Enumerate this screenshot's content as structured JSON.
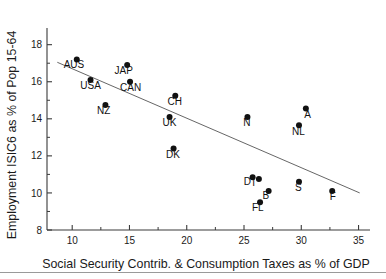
{
  "chart_data": {
    "type": "scatter",
    "title": "",
    "xlabel": "Social Security Contrib. & Consumption Taxes as % of GDP",
    "ylabel": "Employment ISIC6 as % of Pop 15-64",
    "xlim": [
      7.8,
      36.0
    ],
    "ylim": [
      8.0,
      18.9
    ],
    "xticks": [
      10,
      15,
      20,
      25,
      30,
      35
    ],
    "yticks": [
      8,
      10,
      12,
      14,
      16,
      18
    ],
    "xtick_labels": [
      "10",
      "15",
      "20",
      "25",
      "30",
      "35"
    ],
    "ytick_labels": [
      "8",
      "10",
      "12",
      "14",
      "16",
      "18"
    ],
    "grid": false,
    "legend": "none",
    "points": [
      {
        "label": "AUS",
        "x": 10.4,
        "y": 17.2,
        "lx": 10.15,
        "ly": 16.75,
        "anchor": "middle"
      },
      {
        "label": "USA",
        "x": 11.6,
        "y": 16.1,
        "lx": 11.6,
        "ly": 15.6,
        "anchor": "middle"
      },
      {
        "label": "NZ",
        "x": 12.9,
        "y": 14.75,
        "lx": 12.75,
        "ly": 14.25,
        "anchor": "middle"
      },
      {
        "label": "JAP",
        "x": 14.8,
        "y": 16.9,
        "lx": 14.5,
        "ly": 16.4,
        "anchor": "middle"
      },
      {
        "label": "CAN",
        "x": 15.05,
        "y": 16.0,
        "lx": 15.1,
        "ly": 15.5,
        "anchor": "middle"
      },
      {
        "label": "CH",
        "x": 19.0,
        "y": 15.25,
        "lx": 18.95,
        "ly": 14.75,
        "anchor": "middle"
      },
      {
        "label": "UK",
        "x": 18.5,
        "y": 14.1,
        "lx": 18.5,
        "ly": 13.6,
        "anchor": "middle"
      },
      {
        "label": "DK",
        "x": 18.85,
        "y": 12.4,
        "lx": 18.8,
        "ly": 11.9,
        "anchor": "middle"
      },
      {
        "label": "N",
        "x": 25.3,
        "y": 14.1,
        "lx": 25.25,
        "ly": 13.6,
        "anchor": "middle"
      },
      {
        "label": "A",
        "x": 30.4,
        "y": 14.55,
        "lx": 30.55,
        "ly": 14.05,
        "anchor": "middle"
      },
      {
        "label": "NL",
        "x": 29.8,
        "y": 13.65,
        "lx": 29.75,
        "ly": 13.15,
        "anchor": "middle"
      },
      {
        "label": "D",
        "x": 25.75,
        "y": 10.85,
        "lx": 25.3,
        "ly": 10.45,
        "anchor": "middle"
      },
      {
        "label": "I",
        "x": 26.3,
        "y": 10.75,
        "lx": 25.85,
        "ly": 10.4,
        "anchor": "middle"
      },
      {
        "label": "B",
        "x": 27.15,
        "y": 10.1,
        "lx": 26.9,
        "ly": 9.68,
        "anchor": "middle"
      },
      {
        "label": "FL",
        "x": 26.4,
        "y": 9.5,
        "lx": 26.2,
        "ly": 9.0,
        "anchor": "middle"
      },
      {
        "label": "S",
        "x": 29.8,
        "y": 10.6,
        "lx": 29.75,
        "ly": 10.1,
        "anchor": "middle"
      },
      {
        "label": "F",
        "x": 32.7,
        "y": 10.1,
        "lx": 32.75,
        "ly": 9.6,
        "anchor": "middle"
      }
    ],
    "fit_line": {
      "x0": 8.7,
      "y0": 17.05,
      "x1": 35.1,
      "y1": 10.0
    },
    "colors": {
      "marker": "#111111",
      "axis": "#3a3a3a",
      "fit_line": "#555555",
      "text": "#1a1a1a",
      "background": "#ffffff",
      "footer_rule": "#9a9a9a"
    }
  }
}
